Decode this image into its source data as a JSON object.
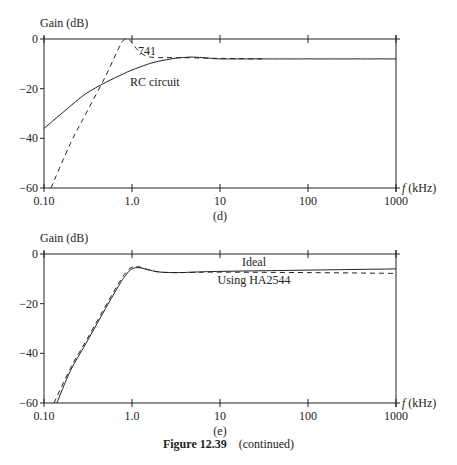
{
  "chart_data": [
    {
      "type": "line",
      "panel_label": "(d)",
      "title": "",
      "ylabel": "Gain (dB)",
      "xlabel": "f (kHz)",
      "xscale": "log",
      "xlim": [
        0.1,
        1000
      ],
      "ylim": [
        -60,
        0
      ],
      "x_ticks": [
        "0.10",
        "1.0",
        "10",
        "100",
        "1000"
      ],
      "y_ticks": [
        "0",
        "−20",
        "−40",
        "−60"
      ],
      "grid": false,
      "series": [
        {
          "name": "RC circuit",
          "style": "solid",
          "x": [
            0.1,
            0.2,
            0.3,
            0.5,
            0.8,
            1.0,
            1.5,
            2.0,
            3.0,
            4.0,
            5.0,
            7.0,
            10,
            30,
            100,
            1000
          ],
          "y": [
            -36,
            -27,
            -22,
            -17.5,
            -14,
            -12.5,
            -10.2,
            -9,
            -7.8,
            -7.4,
            -7.3,
            -7.6,
            -8,
            -8,
            -8,
            -8
          ]
        },
        {
          "name": "741",
          "style": "dashed",
          "x": [
            0.12,
            0.2,
            0.3,
            0.5,
            0.7,
            0.8,
            0.9,
            1.0,
            1.2,
            1.5,
            2.0,
            3.0,
            5.0,
            10,
            30
          ],
          "y": [
            -60,
            -42,
            -30,
            -15,
            -4,
            -0.5,
            0,
            -1.5,
            -5,
            -7,
            -7.5,
            -7.5,
            -7.6,
            -7.8,
            -8
          ]
        }
      ],
      "annotations": [
        "741",
        "RC circuit"
      ]
    },
    {
      "type": "line",
      "panel_label": "(e)",
      "title": "",
      "ylabel": "Gain (dB)",
      "xlabel": "f (kHz)",
      "xscale": "log",
      "xlim": [
        0.1,
        1000
      ],
      "ylim": [
        -60,
        0
      ],
      "x_ticks": [
        "0.10",
        "1.0",
        "10",
        "100",
        "1000"
      ],
      "y_ticks": [
        "0",
        "−20",
        "−40",
        "−60"
      ],
      "grid": false,
      "series": [
        {
          "name": "Ideal",
          "style": "solid",
          "x": [
            0.14,
            0.2,
            0.3,
            0.5,
            0.7,
            0.85,
            1.0,
            1.2,
            1.5,
            2.0,
            3.0,
            5.0,
            10,
            100,
            1000
          ],
          "y": [
            -60,
            -47,
            -36,
            -22,
            -13,
            -8.5,
            -6,
            -5.5,
            -6.3,
            -7.2,
            -7.5,
            -7.3,
            -7,
            -6.5,
            -6
          ]
        },
        {
          "name": "Using HA2544",
          "style": "dashed",
          "x": [
            0.13,
            0.2,
            0.3,
            0.5,
            0.7,
            0.85,
            1.0,
            1.2,
            1.5,
            2.0,
            3.0,
            5.0,
            10,
            100,
            1000
          ],
          "y": [
            -60,
            -46,
            -35,
            -21,
            -12,
            -7.5,
            -5.3,
            -5.2,
            -6.2,
            -7.2,
            -7.5,
            -7.4,
            -7.3,
            -7.5,
            -7.8
          ]
        }
      ],
      "annotations": [
        "Ideal",
        "Using HA2544"
      ]
    }
  ],
  "figure": {
    "caption_label": "Figure 12.39",
    "caption_text": "(continued)"
  },
  "colors": {
    "ink": "#222222",
    "background": "#ffffff"
  }
}
